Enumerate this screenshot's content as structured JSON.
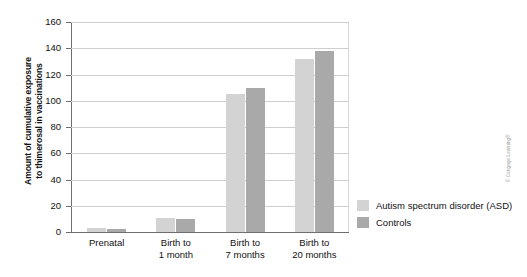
{
  "chart_data": {
    "type": "bar",
    "title": "",
    "xlabel": "",
    "ylabel": "Amount of cumulative exposure\nto thimerosal in vaccinations",
    "ylim": [
      0,
      160
    ],
    "ytick_step": 20,
    "yticks": [
      160,
      140,
      120,
      100,
      80,
      60,
      40,
      20,
      0
    ],
    "ytick_labels": [
      "160",
      "140",
      "120",
      "100",
      "80",
      "60",
      "40",
      "20",
      "0"
    ],
    "grid": true,
    "legend_position": "right",
    "categories": [
      "Prenatal",
      "Birth to\n1 month",
      "Birth to\n7 months",
      "Birth to\n20 months"
    ],
    "series": [
      {
        "name": "Autism spectrum disorder (ASD)",
        "color": "#d3d3d3",
        "values": [
          3,
          11,
          105,
          132
        ]
      },
      {
        "name": "Controls",
        "color": "#a9a9a9",
        "values": [
          2,
          10,
          110,
          138
        ]
      }
    ]
  },
  "legend": {
    "items": [
      {
        "label": "Autism spectrum disorder (ASD)",
        "swatch": "asd"
      },
      {
        "label": "Controls",
        "swatch": "ctl"
      }
    ]
  },
  "credit": {
    "text": "© Cengage Learning®"
  }
}
